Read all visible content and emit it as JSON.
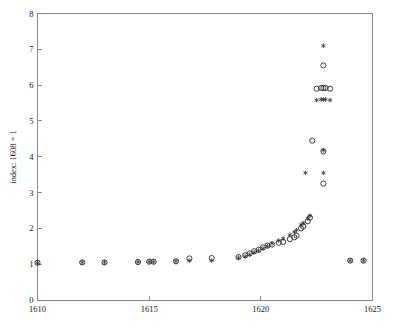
{
  "chart_data": {
    "type": "scatter",
    "title": "",
    "subtitle": "",
    "xlabel": "",
    "ylabel": "index: 1608 = 1",
    "xlim": [
      1610,
      1625
    ],
    "ylim": [
      0,
      8
    ],
    "xticks": [
      1610,
      1615,
      1620,
      1625
    ],
    "yticks": [
      0,
      1,
      2,
      3,
      4,
      5,
      6,
      7,
      8
    ],
    "xtick_labels": [
      "1610",
      "1615",
      "1620",
      "1625"
    ],
    "ytick_labels": [
      "0",
      "1",
      "2",
      "3",
      "4",
      "5",
      "6",
      "7",
      "8"
    ],
    "grid": false,
    "legend": "none",
    "series": [
      {
        "name": "circle-series",
        "marker": "circle",
        "points": [
          [
            1610.0,
            1.04
          ],
          [
            1612.0,
            1.05
          ],
          [
            1613.0,
            1.05
          ],
          [
            1614.5,
            1.06
          ],
          [
            1615.0,
            1.07
          ],
          [
            1615.2,
            1.07
          ],
          [
            1616.2,
            1.08
          ],
          [
            1616.8,
            1.16
          ],
          [
            1617.8,
            1.17
          ],
          [
            1619.0,
            1.2
          ],
          [
            1619.3,
            1.25
          ],
          [
            1619.5,
            1.3
          ],
          [
            1619.7,
            1.36
          ],
          [
            1619.9,
            1.4
          ],
          [
            1620.1,
            1.47
          ],
          [
            1620.3,
            1.52
          ],
          [
            1620.5,
            1.55
          ],
          [
            1620.8,
            1.6
          ],
          [
            1621.0,
            1.62
          ],
          [
            1621.3,
            1.7
          ],
          [
            1621.5,
            1.75
          ],
          [
            1621.6,
            1.8
          ],
          [
            1621.8,
            2.0
          ],
          [
            1621.9,
            2.05
          ],
          [
            1622.1,
            2.2
          ],
          [
            1622.2,
            2.3
          ],
          [
            1622.3,
            4.45
          ],
          [
            1622.8,
            4.15
          ],
          [
            1622.8,
            3.25
          ],
          [
            1622.5,
            5.9
          ],
          [
            1622.7,
            5.92
          ],
          [
            1622.8,
            5.92
          ],
          [
            1622.9,
            5.92
          ],
          [
            1623.1,
            5.9
          ],
          [
            1622.8,
            6.55
          ],
          [
            1624.0,
            1.1
          ],
          [
            1624.6,
            1.1
          ]
        ]
      },
      {
        "name": "star-series",
        "marker": "star",
        "points": [
          [
            1610.0,
            1.04
          ],
          [
            1612.0,
            1.05
          ],
          [
            1613.0,
            1.05
          ],
          [
            1614.5,
            1.06
          ],
          [
            1615.0,
            1.07
          ],
          [
            1615.2,
            1.07
          ],
          [
            1616.2,
            1.08
          ],
          [
            1616.8,
            1.1
          ],
          [
            1617.8,
            1.1
          ],
          [
            1619.0,
            1.18
          ],
          [
            1619.3,
            1.22
          ],
          [
            1619.5,
            1.27
          ],
          [
            1619.7,
            1.33
          ],
          [
            1619.9,
            1.38
          ],
          [
            1620.1,
            1.44
          ],
          [
            1620.3,
            1.5
          ],
          [
            1620.5,
            1.58
          ],
          [
            1620.8,
            1.66
          ],
          [
            1621.0,
            1.72
          ],
          [
            1621.3,
            1.82
          ],
          [
            1621.5,
            1.9
          ],
          [
            1621.6,
            1.95
          ],
          [
            1621.8,
            2.1
          ],
          [
            1621.9,
            2.15
          ],
          [
            1622.1,
            2.28
          ],
          [
            1622.2,
            2.35
          ],
          [
            1622.0,
            3.55
          ],
          [
            1622.8,
            3.55
          ],
          [
            1622.8,
            4.18
          ],
          [
            1622.5,
            5.58
          ],
          [
            1622.7,
            5.6
          ],
          [
            1622.8,
            5.6
          ],
          [
            1622.9,
            5.6
          ],
          [
            1623.1,
            5.58
          ],
          [
            1622.8,
            7.1
          ],
          [
            1624.0,
            1.1
          ],
          [
            1624.6,
            1.1
          ]
        ]
      }
    ]
  },
  "colors": {
    "marker": "#2b2b2b",
    "axis": "#8a8a8a",
    "background": "#ffffff"
  }
}
